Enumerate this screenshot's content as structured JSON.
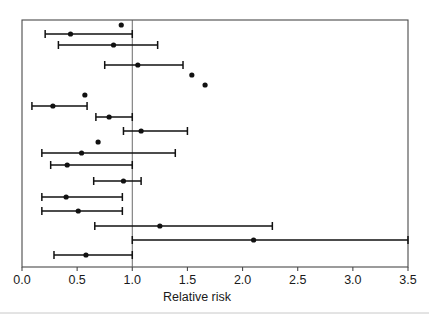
{
  "chart_data": {
    "type": "scatter",
    "subtype": "forest-plot",
    "title": "",
    "xlabel": "Relative risk",
    "ylabel": "",
    "xlim": [
      0.0,
      3.5
    ],
    "ylim": [
      0,
      20
    ],
    "grid": false,
    "legend": null,
    "reference_line": 1.0,
    "xticks": [
      0.0,
      0.5,
      1.0,
      1.5,
      2.0,
      2.5,
      3.0,
      3.5
    ],
    "xtick_labels": [
      "0.0",
      "0.5",
      "1.0",
      "1.5",
      "2.0",
      "2.5",
      "3.0",
      "3.5"
    ],
    "yticks": [],
    "ytick_labels": [],
    "marker": "filled-circle",
    "point_color": "#111111",
    "line_color": "#111111",
    "frame_color": "#4a4a4a",
    "background_color": "#ffffff",
    "series": [
      {
        "name": "Relative risk with 95% CI",
        "points": [
          {
            "row": 1,
            "estimate": 0.9,
            "ci_low": null,
            "ci_high": null
          },
          {
            "row": 2,
            "estimate": 0.44,
            "ci_low": 0.21,
            "ci_high": 1.0
          },
          {
            "row": 3,
            "estimate": 0.83,
            "ci_low": 0.33,
            "ci_high": 1.23
          },
          {
            "row": 4,
            "estimate": 1.05,
            "ci_low": 0.75,
            "ci_high": 1.46
          },
          {
            "row": 5,
            "estimate": 1.54,
            "ci_low": null,
            "ci_high": null
          },
          {
            "row": 6,
            "estimate": 1.66,
            "ci_low": null,
            "ci_high": null
          },
          {
            "row": 7,
            "estimate": 0.57,
            "ci_low": null,
            "ci_high": null
          },
          {
            "row": 8,
            "estimate": 0.28,
            "ci_low": 0.09,
            "ci_high": 0.59
          },
          {
            "row": 9,
            "estimate": 0.79,
            "ci_low": 0.67,
            "ci_high": 1.0
          },
          {
            "row": 10,
            "estimate": 1.08,
            "ci_low": 0.92,
            "ci_high": 1.5
          },
          {
            "row": 11,
            "estimate": 0.69,
            "ci_low": null,
            "ci_high": null
          },
          {
            "row": 12,
            "estimate": 0.54,
            "ci_low": 0.18,
            "ci_high": 1.39
          },
          {
            "row": 13,
            "estimate": 0.41,
            "ci_low": 0.26,
            "ci_high": 1.0
          },
          {
            "row": 14,
            "estimate": 0.92,
            "ci_low": 0.65,
            "ci_high": 1.08
          },
          {
            "row": 15,
            "estimate": 0.4,
            "ci_low": 0.18,
            "ci_high": 0.91
          },
          {
            "row": 16,
            "estimate": 0.51,
            "ci_low": 0.18,
            "ci_high": 0.91
          },
          {
            "row": 17,
            "estimate": 1.25,
            "ci_low": 0.66,
            "ci_high": 2.27
          },
          {
            "row": 18,
            "estimate": 2.1,
            "ci_low": 1.0,
            "ci_high": 3.5
          },
          {
            "row": 19,
            "estimate": 0.58,
            "ci_low": 0.29,
            "ci_high": 1.0
          }
        ]
      }
    ]
  },
  "layout": {
    "plot_left_px": 22,
    "plot_right_px": 408,
    "plot_top_px": 20,
    "plot_bottom_px": 267,
    "row_y_px": [
      25,
      34,
      45,
      65,
      75,
      85,
      95,
      106,
      117,
      131,
      142,
      153,
      165,
      181,
      197,
      211,
      226,
      240,
      255
    ],
    "point_radius_px": 2.6,
    "cap_half_height_px": 4
  }
}
